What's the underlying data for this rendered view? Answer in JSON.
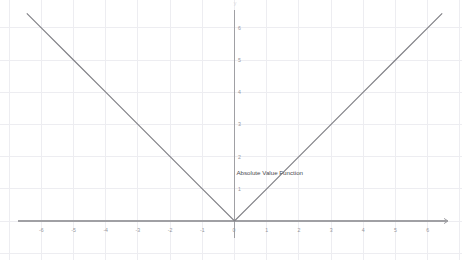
{
  "chart_data": {
    "type": "line",
    "title": "",
    "xlabel": "",
    "ylabel": "y",
    "grid": true,
    "legend_position": "inline-annotation",
    "xlim": [
      -6.4,
      6.7
    ],
    "ylim": [
      0,
      6.45
    ],
    "xticks": [
      -6,
      -5,
      -4,
      -3,
      -2,
      -1,
      0,
      1,
      2,
      3,
      4,
      5,
      6
    ],
    "xtick_labels": [
      "-6",
      "-5",
      "-4",
      "-3",
      "-2",
      "-1",
      "0",
      "1",
      "2",
      "3",
      "4",
      "5",
      "6"
    ],
    "yticks": [
      1,
      2,
      3,
      4,
      5,
      6
    ],
    "ytick_labels": [
      "1",
      "2",
      "3",
      "4",
      "5",
      "6"
    ],
    "series": [
      {
        "name": "Absolute Value Function",
        "formula": "y = |x|",
        "color": "#7f7f85",
        "annotation": "Absolute Value Function",
        "annotation_x": 0.06,
        "annotation_y": 1.44,
        "x": [
          -6.45,
          -6,
          -5,
          -4,
          -3,
          -2,
          -1,
          0,
          1,
          2,
          3,
          4,
          5,
          6,
          6.45
        ],
        "y": [
          6.45,
          6,
          5,
          4,
          3,
          2,
          1,
          0,
          1,
          2,
          3,
          4,
          5,
          6,
          6.45
        ]
      }
    ],
    "colors": {
      "background": "#ffffff",
      "grid": "#ededf1",
      "axis": "#a0a0a4",
      "series": "#7f7f85",
      "tick_label": "#96969c",
      "annotation": "#4a4a50"
    }
  },
  "axes": {
    "x_axis_name": "x-axis",
    "y_axis_name": "y-axis",
    "x_arrow": "right-arrow",
    "y_top_clipped_label": "y"
  }
}
